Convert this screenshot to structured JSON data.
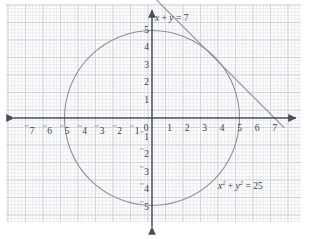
{
  "figure": {
    "type": "math-graph",
    "title": "",
    "background": "#ffffff",
    "grid_color": "#c9cdd4",
    "minor_grid_color": "#e6e8ec",
    "axis_color": "#4a4f55",
    "curve_color": "#8d8f94"
  },
  "axes": {
    "origin_px": {
      "x": 152,
      "y": 118
    },
    "unit_px": 17.5,
    "xlim": [
      -7.8,
      7.9
    ],
    "ylim": [
      -5.6,
      6.4
    ],
    "x_ticks": [
      {
        "value": -7,
        "label": "7",
        "negative": true
      },
      {
        "value": -6,
        "label": "6",
        "negative": true
      },
      {
        "value": -5,
        "label": "5",
        "negative": true
      },
      {
        "value": -4,
        "label": "4",
        "negative": true
      },
      {
        "value": -3,
        "label": "3",
        "negative": true
      },
      {
        "value": -2,
        "label": "2",
        "negative": true
      },
      {
        "value": -1,
        "label": "1",
        "negative": true
      },
      {
        "value": 0,
        "label": "0",
        "negative": false
      },
      {
        "value": 1,
        "label": "1",
        "negative": false
      },
      {
        "value": 2,
        "label": "2",
        "negative": false
      },
      {
        "value": 3,
        "label": "3",
        "negative": false
      },
      {
        "value": 4,
        "label": "4",
        "negative": false
      },
      {
        "value": 5,
        "label": "5",
        "negative": false
      },
      {
        "value": 6,
        "label": "6",
        "negative": false
      },
      {
        "value": 7,
        "label": "7",
        "negative": false
      }
    ],
    "y_ticks": [
      {
        "value": 5,
        "label": "5",
        "negative": false
      },
      {
        "value": 4,
        "label": "4",
        "negative": false
      },
      {
        "value": 3,
        "label": "3",
        "negative": false
      },
      {
        "value": 2,
        "label": "2",
        "negative": false
      },
      {
        "value": 1,
        "label": "1",
        "negative": false
      },
      {
        "value": -1,
        "label": "1",
        "negative": true
      },
      {
        "value": -2,
        "label": "2",
        "negative": true
      },
      {
        "value": -3,
        "label": "3",
        "negative": true
      },
      {
        "value": -4,
        "label": "4",
        "negative": true
      },
      {
        "value": -5,
        "label": "5",
        "negative": true
      }
    ]
  },
  "chart_data": {
    "type": "line",
    "title": "",
    "xlabel": "",
    "ylabel": "",
    "xlim": [
      -7.8,
      7.9
    ],
    "ylim": [
      -5.6,
      6.4
    ],
    "grid": true,
    "legend": "none",
    "series": [
      {
        "name": "circle",
        "equation": "x^2 + y^2 = 25",
        "kind": "circle",
        "center": [
          0,
          0
        ],
        "radius": 5,
        "color": "#8d8f94",
        "x_intercepts": [
          -5,
          5
        ],
        "y_intercepts": [
          -5,
          5
        ]
      },
      {
        "name": "line",
        "equation": "x + y = 7",
        "kind": "straight-line",
        "slope": -1,
        "intercept": 7,
        "color": "#8d8f94",
        "x_intercept": 7,
        "y_intercept": 7,
        "drawn_from": [
          0.05,
          6.95
        ],
        "drawn_to": [
          7.55,
          -0.55
        ]
      }
    ],
    "annotations": [
      {
        "name": "line-label",
        "text": "x + y = 7",
        "x": 0.35,
        "y": 5.55
      },
      {
        "name": "circle-label",
        "text": "x2 + y2 = 25",
        "x": 3.9,
        "y": -3.75
      }
    ]
  },
  "labels": {
    "line_eq": {
      "lhs_x": "x",
      "plus": " + ",
      "lhs_y": "y",
      "equals": " = ",
      "rhs": "7"
    },
    "circle_eq": {
      "x": "x",
      "x_pow": "2",
      "plus": " + ",
      "y": "y",
      "y_pow": "2",
      "equals": " = ",
      "rhs": "25"
    }
  }
}
